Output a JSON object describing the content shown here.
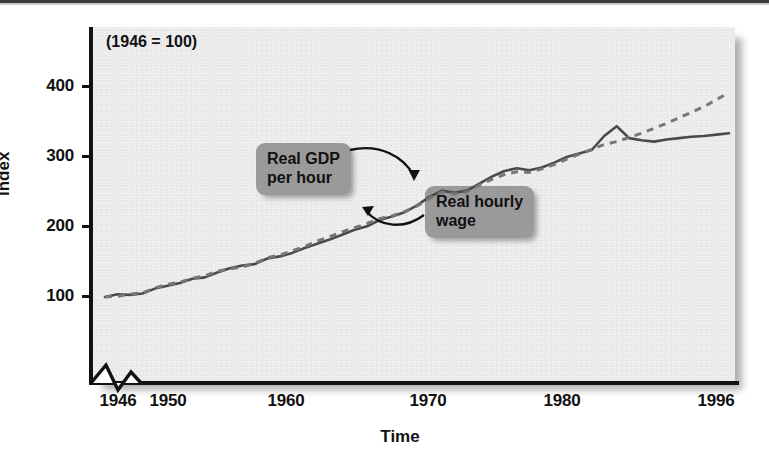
{
  "figure": {
    "note": "(1946 = 100)",
    "axis_title_y": "Index",
    "axis_title_x": "Time"
  },
  "callouts": {
    "gdp": {
      "line1": "Real GDP",
      "line2": "per hour"
    },
    "wage": {
      "line1": "Real hourly",
      "line2": "wage"
    }
  },
  "colors": {
    "panel": "#ebebeb",
    "axis": "#121212",
    "callout_bg": "#9a9a9a",
    "series_solid": "#4a4a4a",
    "series_dashed": "#707070"
  },
  "chart_data": {
    "type": "line",
    "title": "",
    "subtitle": "(1946 = 100)",
    "xlabel": "Time",
    "ylabel": "Index",
    "xlim": [
      1946,
      1996
    ],
    "ylim": [
      0,
      440
    ],
    "yticks": [
      100,
      200,
      300,
      400
    ],
    "ytick_labels": [
      "100",
      "200",
      "300",
      "400"
    ],
    "xticks": [
      1946,
      1950,
      1960,
      1970,
      1980,
      1996
    ],
    "xtick_labels": [
      "1946",
      "1950",
      "1960",
      "1970",
      "1980",
      "1996"
    ],
    "grid": false,
    "legend": "annotations-inline",
    "axis_break_x": true,
    "annotations": [
      {
        "text": "Real GDP per hour",
        "points_to": "dashed-series"
      },
      {
        "text": "Real hourly wage",
        "points_to": "solid-series"
      }
    ],
    "x": [
      1946,
      1947,
      1948,
      1949,
      1950,
      1951,
      1952,
      1953,
      1954,
      1955,
      1956,
      1957,
      1958,
      1959,
      1960,
      1961,
      1962,
      1963,
      1964,
      1965,
      1966,
      1967,
      1968,
      1969,
      1970,
      1971,
      1972,
      1973,
      1974,
      1975,
      1976,
      1977,
      1978,
      1979,
      1980,
      1981,
      1982,
      1983,
      1984,
      1985,
      1986,
      1987,
      1988,
      1989,
      1990,
      1991,
      1992,
      1993,
      1994,
      1995,
      1996
    ],
    "series": [
      {
        "name": "Real hourly wage",
        "style": "solid",
        "values": [
          100,
          104,
          103,
          105,
          112,
          116,
          120,
          126,
          128,
          135,
          141,
          145,
          147,
          155,
          158,
          163,
          170,
          176,
          182,
          189,
          196,
          201,
          210,
          215,
          221,
          231,
          243,
          252,
          249,
          252,
          262,
          272,
          280,
          284,
          281,
          285,
          292,
          300,
          305,
          310,
          330,
          344,
          327,
          324,
          322,
          325,
          327,
          329,
          330,
          332,
          334
        ]
      },
      {
        "name": "Real GDP per hour",
        "style": "dashed",
        "values": [
          100,
          101,
          104,
          106,
          113,
          118,
          121,
          127,
          130,
          137,
          140,
          143,
          148,
          156,
          160,
          166,
          172,
          180,
          186,
          193,
          199,
          205,
          212,
          216,
          222,
          230,
          241,
          250,
          247,
          250,
          260,
          268,
          275,
          279,
          278,
          283,
          289,
          297,
          304,
          311,
          318,
          322,
          328,
          334,
          341,
          348,
          356,
          364,
          372,
          382,
          392
        ]
      }
    ]
  }
}
